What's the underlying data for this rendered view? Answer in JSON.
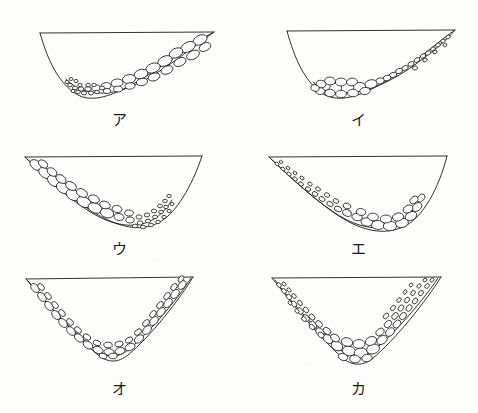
{
  "figure": {
    "background_color": "#fdfdfb",
    "ink_color": "#1a1a1a",
    "clast_fill_color": "#ffffff",
    "width": 478,
    "height": 413,
    "type": "line-drawing",
    "panel_count": 6,
    "columns": 2,
    "rows": 3
  },
  "panels": [
    {
      "label": "ア",
      "label_romaji": "a",
      "position": "row1-left",
      "valley_profile": "asymmetric, steep left wall, gentle right slope",
      "rim_line": "straight horizontal line joining left and right rims",
      "clast_description": "large rounded clasts blanket the gentle right slope; fine gravel collects at the valley floor",
      "clast_size_gradient": "coarse upslope right, fine at bottom"
    },
    {
      "label": "イ",
      "label_romaji": "i",
      "position": "row1-right",
      "valley_profile": "asymmetric, steep left wall, gentle right slope",
      "rim_line": "straight horizontal line joining left and right rims",
      "clast_description": "fine gravel thins along the gentle right slope; large rounded clasts accumulate on the valley floor",
      "clast_size_gradient": "fine upslope right, coarse at bottom"
    },
    {
      "label": "ウ",
      "label_romaji": "u",
      "position": "row2-left",
      "valley_profile": "asymmetric, gentle left slope, steep right wall",
      "rim_line": "straight horizontal line joining left and right rims",
      "clast_description": "large rounded clasts blanket the gentle left slope; fine gravel collects in the valley floor toward the right",
      "clast_size_gradient": "coarse upslope left, fine at bottom"
    },
    {
      "label": "エ",
      "label_romaji": "e",
      "position": "row2-right",
      "valley_profile": "asymmetric, gentle left slope, steep right wall",
      "rim_line": "straight horizontal line joining left and right rims",
      "clast_description": "fine gravel thins along the gentle left slope; large rounded clasts accumulate on the valley floor toward the right",
      "clast_size_gradient": "fine upslope left, coarse at bottom"
    },
    {
      "label": "オ",
      "label_romaji": "o",
      "position": "row3-left",
      "valley_profile": "symmetric V-shaped valley",
      "rim_line": "straight horizontal line joining left and right rims",
      "clast_description": "a thin, even veneer of rounded clasts lines both slopes and the floor",
      "clast_size_gradient": "uniform clast size throughout"
    },
    {
      "label": "カ",
      "label_romaji": "ka",
      "position": "row3-right",
      "valley_profile": "symmetric V-shaped valley",
      "rim_line": "straight horizontal line joining left and right rims",
      "clast_description": "thick angular clast fill on both slopes; clasts enlarge markedly toward the valley floor",
      "clast_size_gradient": "fine near the rims, coarse at bottom"
    }
  ]
}
